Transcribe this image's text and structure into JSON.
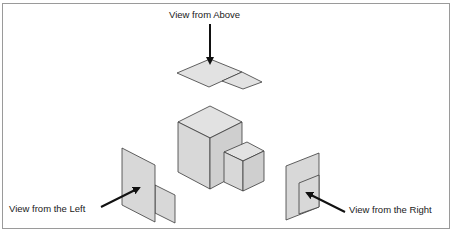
{
  "diagram": {
    "labels": {
      "above": "View from Above",
      "left": "View from the Left",
      "right": "View from the Right"
    },
    "colors": {
      "face_fill": "#d8d8d8",
      "face_fill_light": "#e2e2e2",
      "face_fill_dark": "#cfcfcf",
      "stroke": "#3a3a3a",
      "arrow": "#111111",
      "frame": "#9a9a9a"
    },
    "shapes": {
      "above_large": "177,73 210,59 242,72 209,87",
      "above_small": "222,81 242,72 262,82 243,89",
      "cube_large_top": "178,122 210,106 242,122 210,138",
      "cube_large_left": "178,122 210,138 210,189 178,172",
      "cube_large_right": "210,138 242,122 242,172 210,189",
      "cube_small_top": "224,152 247,142 264,151 243,161",
      "cube_small_left": "224,152 243,161 243,191 224,182",
      "cube_small_right": "243,161 264,151 264,181 243,191",
      "left_large": "122,148 155,165 155,222 122,205",
      "left_small": "155,185 175,195 175,223 155,213",
      "right_large": "286,166 319,153 319,207 286,220",
      "right_small": "299,183 319,175 319,207 299,214"
    },
    "arrows": {
      "above": {
        "x1": 210,
        "y1": 24,
        "x2": 210,
        "y2": 63
      },
      "left": {
        "x1": 101,
        "y1": 207,
        "x2": 139,
        "y2": 188
      },
      "right": {
        "x1": 345,
        "y1": 212,
        "x2": 307,
        "y2": 193
      }
    }
  }
}
